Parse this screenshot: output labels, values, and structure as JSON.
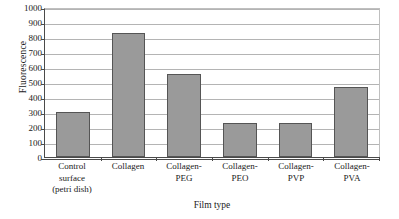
{
  "chart_data": {
    "type": "bar",
    "title": "",
    "xlabel": "Film type",
    "ylabel": "Fluorescence",
    "categories": [
      "Control surface (petri dish)",
      "Collagen",
      "Collagen-PEG",
      "Collagen-PEO",
      "Collagen-PVP",
      "Collagen-PVA"
    ],
    "category_lines": [
      [
        "Control",
        "surface",
        "(petri dish)"
      ],
      [
        "Collagen"
      ],
      [
        "Collagen-",
        "PEG"
      ],
      [
        "Collagen-",
        "PEO"
      ],
      [
        "Collagen-",
        "PVP"
      ],
      [
        "Collagen-",
        "PVA"
      ]
    ],
    "values": [
      300,
      825,
      555,
      230,
      225,
      470
    ],
    "ylim": [
      0,
      1000
    ],
    "ytick_step": 100,
    "yticks": [
      1000,
      900,
      800,
      700,
      600,
      500,
      400,
      300,
      200,
      100,
      0
    ],
    "grid": true,
    "legend": "none",
    "bar_fill_color": "#9a9a9a",
    "bar_border_color": "#555555",
    "gridline_color": "#b4b4b4",
    "axis_color": "#4a4a4a"
  }
}
